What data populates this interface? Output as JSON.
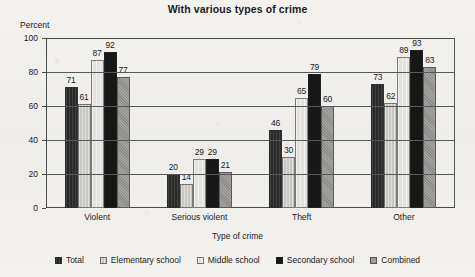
{
  "chart_data": {
    "type": "bar",
    "title": "With various types of crime",
    "xlabel": "Type of crime",
    "ylabel": "Percent",
    "ylim": [
      0,
      100
    ],
    "yticks": [
      0,
      20,
      40,
      60,
      80,
      100
    ],
    "grid": true,
    "legend_position": "bottom",
    "categories": [
      "Violent",
      "Serious violent",
      "Theft",
      "Other"
    ],
    "series": [
      {
        "name": "Total",
        "color": "#2a2a2a",
        "values": [
          71,
          20,
          46,
          73
        ]
      },
      {
        "name": "Elementary school",
        "color": "#c9c7c2",
        "values": [
          61,
          14,
          30,
          62
        ]
      },
      {
        "name": "Middle school",
        "color": "#e3e1dc",
        "values": [
          87,
          29,
          65,
          89
        ]
      },
      {
        "name": "Secondary school",
        "color": "#171717",
        "values": [
          92,
          29,
          79,
          93
        ]
      },
      {
        "name": "Combined",
        "color": "#8d8b87",
        "values": [
          77,
          21,
          60,
          83
        ]
      }
    ]
  }
}
